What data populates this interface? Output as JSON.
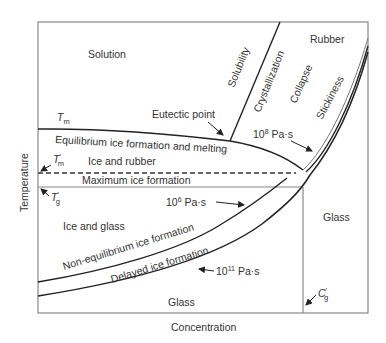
{
  "diagram": {
    "axes": {
      "x_label": "Concentration",
      "y_label": "Temperature"
    },
    "regions": {
      "solution": "Solution",
      "rubber": "Rubber",
      "ice_and_rubber": "Ice and rubber",
      "ice_and_glass": "Ice and glass",
      "glass_right": "Glass",
      "glass_bottom": "Glass"
    },
    "curves": {
      "solubility": "Solubility",
      "crystallization": "Crystallization",
      "collapse": "Collapse",
      "stickiness": "Stickiness",
      "equilibrium": "Equilibrium ice formation and melting",
      "maximum": "Maximum ice formation",
      "non_equilibrium": "Non-equilibrium ice formation",
      "delayed": "Delayed ice formation"
    },
    "annotations": {
      "tm": "T",
      "tm_sub": "m",
      "tm_prime": "T",
      "tm_prime_sub": "m",
      "tm_prime_mark": "′",
      "tg_prime": "T",
      "tg_prime_sub": "g",
      "tg_prime_mark": "′",
      "cg_prime": "C",
      "cg_prime_sub": "g",
      "cg_prime_mark": "′",
      "eutectic": "Eutectic point",
      "visc8_base": "10",
      "visc8_exp": "8",
      "visc8_unit": " Pa·s",
      "visc6_base": "10",
      "visc6_exp": "6",
      "visc6_unit": " Pa·s",
      "visc11_base": "10",
      "visc11_exp": "11",
      "visc11_unit": " Pa·s"
    }
  }
}
